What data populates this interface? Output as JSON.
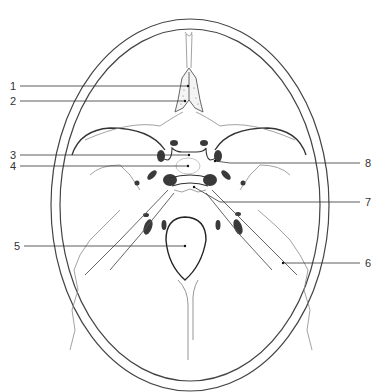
{
  "figure": {
    "type": "anatomical-line-drawing",
    "colors": {
      "outline": "#444444",
      "fine_line": "#8a8a8a",
      "fill_dark": "#3a3a3a",
      "leader": "#333333",
      "background": "#ffffff"
    }
  },
  "labels": [
    {
      "id": "1",
      "text": "1",
      "side": "left",
      "label_xy": [
        12,
        86
      ],
      "target_xy": [
        188,
        86
      ]
    },
    {
      "id": "2",
      "text": "2",
      "side": "left",
      "label_xy": [
        12,
        101
      ],
      "target_xy": [
        185,
        101
      ]
    },
    {
      "id": "3",
      "text": "3",
      "side": "left",
      "label_xy": [
        12,
        155
      ],
      "target_xy": [
        189,
        155
      ]
    },
    {
      "id": "4",
      "text": "4",
      "side": "left",
      "label_xy": [
        12,
        166
      ],
      "target_xy": [
        188,
        166
      ]
    },
    {
      "id": "5",
      "text": "5",
      "side": "left",
      "label_xy": [
        16,
        246
      ],
      "target_xy": [
        185,
        246
      ]
    },
    {
      "id": "6",
      "text": "6",
      "side": "right",
      "label_xy": [
        366,
        263
      ],
      "target_xy": [
        283,
        263
      ]
    },
    {
      "id": "7",
      "text": "7",
      "side": "right",
      "label_xy": [
        366,
        202
      ],
      "target_xy": [
        194,
        187
      ]
    },
    {
      "id": "8",
      "text": "8",
      "side": "right",
      "label_xy": [
        366,
        163
      ],
      "target_xy": [
        215,
        161
      ]
    }
  ]
}
